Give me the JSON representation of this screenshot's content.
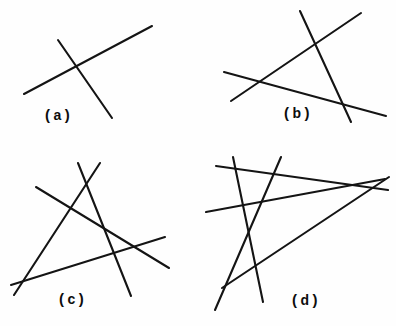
{
  "figure": {
    "background_color": "#fefefe",
    "line_color": "#141414",
    "width": 396,
    "height": 326
  },
  "captions": {
    "a": {
      "open": "(",
      "letter": "a",
      "close": ")"
    },
    "b": {
      "open": "(",
      "letter": "b",
      "close": ")"
    },
    "c": {
      "open": "(",
      "letter": "c",
      "close": ")"
    },
    "d": {
      "open": "(",
      "letter": "d",
      "close": ")"
    }
  },
  "chart_data": {
    "type": "line",
    "xlabel": "",
    "ylabel": "",
    "xlim": [
      0,
      396
    ],
    "ylim": [
      0,
      326
    ],
    "grid": false,
    "legend": "none",
    "panels": [
      {
        "label": "a",
        "line_count": 2,
        "intersection_count": 1,
        "caption_position": [
          44,
          106
        ],
        "segments": [
          {
            "name": "a-shallow-rising",
            "x1": 24,
            "y1": 94,
            "x2": 152,
            "y2": 26
          },
          {
            "name": "a-steep-falling",
            "x1": 58,
            "y1": 40,
            "x2": 112,
            "y2": 118
          }
        ]
      },
      {
        "label": "b",
        "line_count": 3,
        "intersection_count": 3,
        "caption_position": [
          283,
          104
        ],
        "segments": [
          {
            "name": "b-steep-falling",
            "x1": 300,
            "y1": 11,
            "x2": 351,
            "y2": 122
          },
          {
            "name": "b-diagonal-rising",
            "x1": 231,
            "y1": 101,
            "x2": 361,
            "y2": 13
          },
          {
            "name": "b-shallow-falling",
            "x1": 224,
            "y1": 72,
            "x2": 386,
            "y2": 116
          }
        ]
      },
      {
        "label": "c",
        "line_count": 4,
        "intersection_count": 6,
        "caption_position": [
          58,
          290
        ],
        "segments": [
          {
            "name": "c-steep-right-falling",
            "x1": 78,
            "y1": 163,
            "x2": 131,
            "y2": 296
          },
          {
            "name": "c-steep-left-rising",
            "x1": 100,
            "y1": 163,
            "x2": 14,
            "y2": 295
          },
          {
            "name": "c-diagonal-falling",
            "x1": 36,
            "y1": 187,
            "x2": 169,
            "y2": 268
          },
          {
            "name": "c-shallow-rising",
            "x1": 11,
            "y1": 285,
            "x2": 165,
            "y2": 237
          }
        ]
      },
      {
        "label": "d",
        "line_count": 5,
        "intersection_count": 10,
        "caption_position": [
          291,
          291
        ],
        "segments": [
          {
            "name": "d-steep-left-falling",
            "x1": 233,
            "y1": 157,
            "x2": 263,
            "y2": 302
          },
          {
            "name": "d-steep-right-rising",
            "x1": 281,
            "y1": 157,
            "x2": 215,
            "y2": 310
          },
          {
            "name": "d-upper-shallow-falling",
            "x1": 216,
            "y1": 166,
            "x2": 388,
            "y2": 190
          },
          {
            "name": "d-mid-shallow-rising",
            "x1": 206,
            "y1": 212,
            "x2": 385,
            "y2": 179
          },
          {
            "name": "d-long-diagonal-rising",
            "x1": 222,
            "y1": 288,
            "x2": 389,
            "y2": 177
          }
        ]
      }
    ]
  }
}
